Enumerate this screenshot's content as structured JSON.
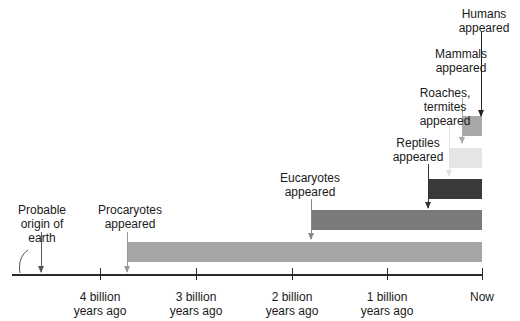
{
  "diagram": {
    "type": "timeline",
    "axis": {
      "ticks": [
        {
          "label": "4 billion\nyears ago",
          "value": 4
        },
        {
          "label": "3 billion\nyears ago",
          "value": 3
        },
        {
          "label": "2 billion\nyears ago",
          "value": 2
        },
        {
          "label": "1 billion\nyears ago",
          "value": 1
        },
        {
          "label": "Now",
          "value": 0
        }
      ]
    },
    "events": [
      {
        "label": "Probable\norigin of\nearth",
        "start_bya": 4.6,
        "bar": false
      },
      {
        "label": "Procaryotes\nappeared",
        "start_bya": 3.7,
        "bar": true,
        "color": "#a6a6a6"
      },
      {
        "label": "Eucaryotes\nappeared",
        "start_bya": 1.8,
        "bar": true,
        "color": "#7a7a7a"
      },
      {
        "label": "Reptiles\nappeared",
        "start_bya": 0.55,
        "bar": true,
        "color": "#3a3a3a"
      },
      {
        "label": "Roaches,\ntermites\nappeared",
        "start_bya": 0.35,
        "bar": true,
        "color": "#e6e6e6"
      },
      {
        "label": "Mammals\nappeared",
        "start_bya": 0.2,
        "bar": true,
        "color": "#a8a8a8"
      },
      {
        "label": "Humans\nappeared",
        "start_bya": 0.002,
        "bar": false
      }
    ]
  }
}
